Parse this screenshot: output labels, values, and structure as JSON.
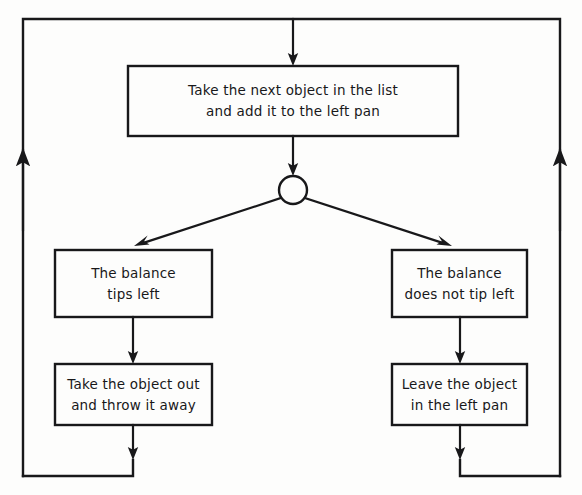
{
  "diagram": {
    "type": "flowchart",
    "ink_color": "#18181a",
    "background_color": "#fdfdfc",
    "nodes": {
      "process_add": {
        "shape": "rectangle",
        "line1": "Take the next object in the list",
        "line2": "and add it to the left pan"
      },
      "decision": {
        "shape": "circle",
        "label": ""
      },
      "cond_tips_left": {
        "shape": "rectangle",
        "line1": "The balance",
        "line2": "tips left"
      },
      "cond_not_tip_left": {
        "shape": "rectangle",
        "line1": "The balance",
        "line2": "does not tip left"
      },
      "action_remove": {
        "shape": "rectangle",
        "line1": "Take the object out",
        "line2": "and throw it away"
      },
      "action_keep": {
        "shape": "rectangle",
        "line1": "Leave the object",
        "line2": "in the left pan"
      }
    },
    "edges": [
      {
        "name": "entry-into-process",
        "from": "loop-top",
        "to": "process_add",
        "arrow": "down"
      },
      {
        "name": "process-to-decision",
        "from": "process_add",
        "to": "decision",
        "arrow": "down"
      },
      {
        "name": "decision-to-tips-left",
        "from": "decision",
        "to": "cond_tips_left",
        "arrow": "diagonal-down-left"
      },
      {
        "name": "decision-to-not-tip-left",
        "from": "decision",
        "to": "cond_not_tip_left",
        "arrow": "diagonal-down-right"
      },
      {
        "name": "tips-left-to-remove",
        "from": "cond_tips_left",
        "to": "action_remove",
        "arrow": "down"
      },
      {
        "name": "not-tip-left-to-keep",
        "from": "cond_not_tip_left",
        "to": "action_keep",
        "arrow": "down"
      },
      {
        "name": "remove-to-loop-left",
        "from": "action_remove",
        "to": "loop-left",
        "arrow": "down"
      },
      {
        "name": "keep-to-loop-right",
        "from": "action_keep",
        "to": "loop-right",
        "arrow": "down"
      },
      {
        "name": "loop-return-left",
        "from": "loop-left",
        "to": "loop-top",
        "arrow": "up"
      },
      {
        "name": "loop-return-right",
        "from": "loop-right",
        "to": "loop-top",
        "arrow": "up"
      }
    ]
  }
}
